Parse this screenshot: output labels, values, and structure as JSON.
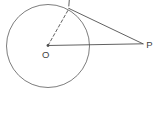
{
  "figure": {
    "labels": {
      "center": "O",
      "external_point": "P"
    },
    "colors": {
      "background": "#ffffff",
      "line": "#4f4f4f",
      "circle_stroke": "#6e6e6e",
      "label": "#3f3f3f"
    },
    "geometry": {
      "circle": {
        "cx": 48,
        "cy": 46,
        "r": 41.5
      },
      "center_dot": {
        "cx": 48,
        "cy": 45.5,
        "r": 1.4
      },
      "dashed_radius": {
        "x1": 48,
        "y1": 45.5,
        "x2": 69,
        "y2": 8.5,
        "dash": "3 2.3"
      },
      "center_to_p": {
        "x1": 48,
        "y1": 45.5,
        "x2": 143,
        "y2": 43.8
      },
      "tangent_line": {
        "x1": 69,
        "y1": 8.5,
        "x2": 143,
        "y2": 43.8
      },
      "tangent_tick": {
        "x1": 69.3,
        "y1": 0,
        "x2": 68.8,
        "y2": 6
      },
      "center_label_pos": {
        "x": 45.8,
        "y": 57.5
      },
      "external_label_pos": {
        "x": 149.5,
        "y": 47.5
      }
    }
  }
}
